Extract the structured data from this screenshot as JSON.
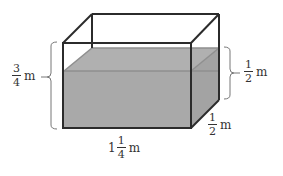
{
  "diagram": {
    "type": "rectangular-prism-tank",
    "colors": {
      "edge": "#2b2b2b",
      "water_fill": "#a9a9a9",
      "water_edge": "#8f8f8f",
      "brace": "#777777",
      "text": "#333333"
    },
    "labels": {
      "tank_height": {
        "numerator": "3",
        "denominator": "4",
        "unit": "m"
      },
      "water_height": {
        "numerator": "1",
        "denominator": "2",
        "unit": "m"
      },
      "depth": {
        "numerator": "1",
        "denominator": "2",
        "unit": "m"
      },
      "length": {
        "whole": "1",
        "numerator": "1",
        "denominator": "4",
        "unit": "m"
      }
    }
  }
}
